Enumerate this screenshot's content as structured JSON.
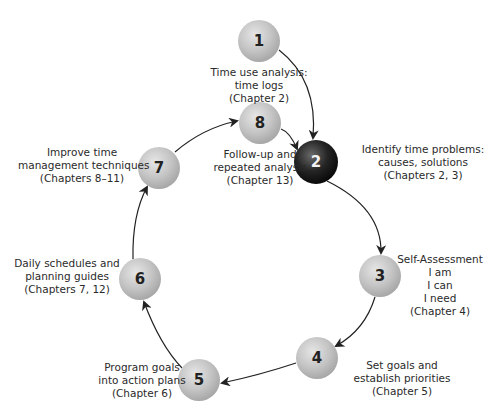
{
  "diagram": {
    "type": "cycle",
    "colors": {
      "node_fill": "#c2c2c2",
      "node_highlight_fill": "#1e1e1e",
      "arrow": "#222222",
      "text": "#2a2a2a"
    },
    "nodes": [
      {
        "id": "1",
        "number": "1",
        "lines": [
          "Time use analysis:",
          "time logs",
          "(Chapter 2)"
        ]
      },
      {
        "id": "2",
        "number": "2",
        "highlighted": true,
        "lines": [
          "Identify time problems:",
          "causes, solutions",
          "(Chapters 2, 3)"
        ]
      },
      {
        "id": "3",
        "number": "3",
        "lines": [
          "Self-Assessment",
          "I am",
          "I can",
          "I need",
          "(Chapter 4)"
        ]
      },
      {
        "id": "4",
        "number": "4",
        "lines": [
          "Set goals and",
          "establish priorities",
          "(Chapter 5)"
        ]
      },
      {
        "id": "5",
        "number": "5",
        "lines": [
          "Program goals",
          "into action plans",
          "(Chapter 6)"
        ]
      },
      {
        "id": "6",
        "number": "6",
        "lines": [
          "Daily schedules and",
          "planning guides",
          "(Chapters 7, 12)"
        ]
      },
      {
        "id": "7",
        "number": "7",
        "lines": [
          "Improve time",
          "management techniques",
          "(Chapters 8–11)"
        ]
      },
      {
        "id": "8",
        "number": "8",
        "lines": [
          "Follow-up and",
          "repeated analysis",
          "(Chapter 13)"
        ]
      }
    ],
    "edges": [
      {
        "from": "1",
        "to": "2"
      },
      {
        "from": "8",
        "to": "2"
      },
      {
        "from": "2",
        "to": "3"
      },
      {
        "from": "3",
        "to": "4"
      },
      {
        "from": "4",
        "to": "5"
      },
      {
        "from": "5",
        "to": "6"
      },
      {
        "from": "6",
        "to": "7"
      },
      {
        "from": "7",
        "to": "8"
      }
    ]
  }
}
